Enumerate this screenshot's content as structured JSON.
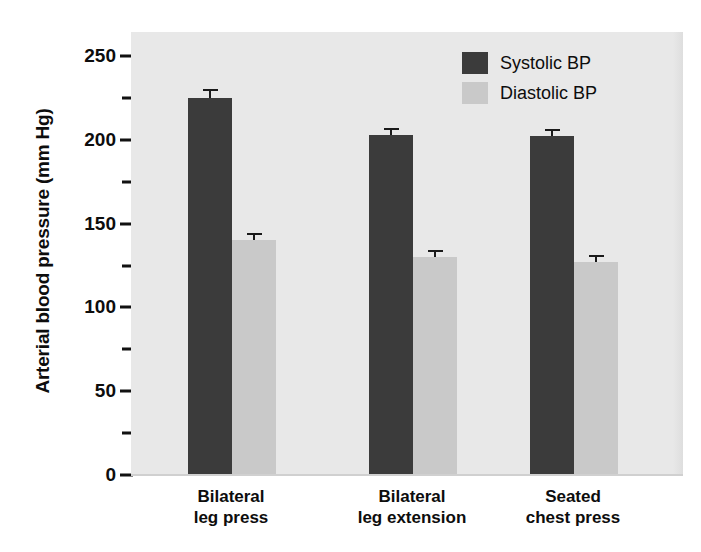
{
  "chart_data": {
    "type": "bar",
    "title": "",
    "xlabel": "",
    "ylabel": "Arterial blood pressure (mm Hg)",
    "ylim": [
      0,
      250
    ],
    "ytick_values": [
      0,
      50,
      100,
      150,
      200,
      250
    ],
    "ytick_labels": [
      "0",
      "50",
      "100",
      "150",
      "200",
      "250"
    ],
    "yminor_ticks": [
      25,
      75,
      125,
      175,
      225
    ],
    "grid": false,
    "legend_position": "top-right",
    "categories": [
      "Bilateral leg press",
      "Bilateral leg extension",
      "Seated chest press"
    ],
    "category_lines": [
      [
        "Bilateral",
        "leg press"
      ],
      [
        "Bilateral",
        "leg extension"
      ],
      [
        "Seated",
        "chest press"
      ]
    ],
    "series": [
      {
        "name": "Systolic BP",
        "color": "#3b3b3b",
        "values": [
          225,
          203,
          202
        ],
        "errors": [
          4,
          3,
          3
        ]
      },
      {
        "name": "Diastolic BP",
        "color": "#c9c9c9",
        "values": [
          140,
          130,
          127
        ],
        "errors": [
          3,
          3,
          3
        ]
      }
    ]
  },
  "axis": {
    "ylabel": "Arterial blood pressure (mm Hg)",
    "tick_250": "250",
    "tick_200": "200",
    "tick_150": "150",
    "tick_100": "100",
    "tick_50": "50",
    "tick_0": "0"
  },
  "legend": {
    "items": [
      {
        "label": "Systolic BP",
        "color": "#3b3b3b"
      },
      {
        "label": "Diastolic BP",
        "color": "#c9c9c9"
      }
    ]
  },
  "categories": [
    {
      "line1": "Bilateral",
      "line2": "leg press"
    },
    {
      "line1": "Bilateral",
      "line2": "leg extension"
    },
    {
      "line1": "Seated",
      "line2": "chest press"
    }
  ],
  "colors": {
    "systolic": "#3b3b3b",
    "diastolic": "#c9c9c9",
    "plot_background": "#e8e8e8",
    "text": "#0d0d0d"
  }
}
